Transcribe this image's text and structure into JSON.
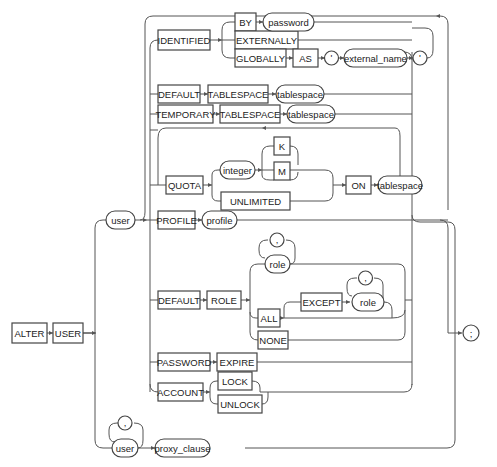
{
  "diagram": {
    "keywords": {
      "alter": "ALTER",
      "user_kw": "USER",
      "identified": "IDENTIFIED",
      "by": "BY",
      "externally": "EXTERNALLY",
      "globally": "GLOBALLY",
      "as": "AS",
      "default1": "DEFAULT",
      "tablespace1": "TABLESPACE",
      "temporary": "TEMPORARY",
      "tablespace2": "TABLESPACE",
      "quota": "QUOTA",
      "unlimited": "UNLIMITED",
      "k": "K",
      "m": "M",
      "on": "ON",
      "profile_kw": "PROFILE",
      "default2": "DEFAULT",
      "role_kw": "ROLE",
      "all": "ALL",
      "except": "EXCEPT",
      "none": "NONE",
      "password_kw": "PASSWORD",
      "expire": "EXPIRE",
      "account": "ACCOUNT",
      "lock": "LOCK",
      "unlock": "UNLOCK"
    },
    "variables": {
      "user1": "user",
      "password": "password",
      "external_name": "external_name",
      "tablespace1": "tablespace",
      "tablespace2": "tablespace",
      "integer": "integer",
      "tablespace3": "tablespace",
      "profile": "profile",
      "role1": "role",
      "role2": "role",
      "user2": "user",
      "proxy_clause": "proxy_clause"
    },
    "punctuation": {
      "quote_open": "'",
      "quote_close": "'",
      "comma_role1": ",",
      "comma_role2": ",",
      "comma_user": ",",
      "terminator": ";"
    }
  }
}
